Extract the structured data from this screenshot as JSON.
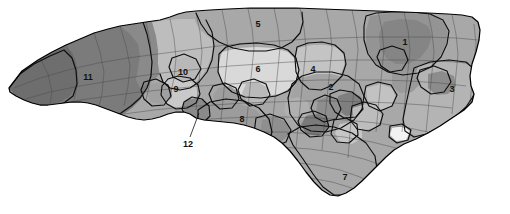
{
  "map": {
    "name": "north-carolina-congressional-districts",
    "background_color": "#ffffff",
    "state_outline_color": "#000000",
    "district_border_color": "#0d0d0d",
    "county_border_color": "#4a4a4a",
    "label_color": "#111111",
    "palette": {
      "darkest": "#6e6e6e",
      "dark": "#7b7b7b",
      "mid_dark": "#878787",
      "mid": "#949494",
      "mid_light": "#a3a3a3",
      "light": "#b4b4b4",
      "lighter": "#c4c4c4",
      "lightest": "#d9d9d9",
      "white": "#f4f4f4"
    },
    "districts": [
      {
        "id": "1",
        "label": "1",
        "x": 405,
        "y": 43,
        "fill": "#949494"
      },
      {
        "id": "2",
        "label": "2",
        "x": 331,
        "y": 88,
        "fill": "#a3a3a3"
      },
      {
        "id": "3",
        "label": "3",
        "x": 452,
        "y": 90,
        "fill": "#b4b4b4"
      },
      {
        "id": "4",
        "label": "4",
        "x": 313,
        "y": 70,
        "fill": "#c4c4c4"
      },
      {
        "id": "5",
        "label": "5",
        "x": 258,
        "y": 25,
        "fill": "#a8a8a8"
      },
      {
        "id": "6",
        "label": "6",
        "x": 258,
        "y": 70,
        "fill": "#d9d9d9"
      },
      {
        "id": "7",
        "label": "7",
        "x": 345,
        "y": 178,
        "fill": "#a8a8a8"
      },
      {
        "id": "8",
        "label": "8",
        "x": 242,
        "y": 120,
        "fill": "#9c9c9c"
      },
      {
        "id": "9",
        "label": "9",
        "x": 176,
        "y": 90,
        "fill": "#c9c9c9"
      },
      {
        "id": "10",
        "label": "10",
        "x": 183,
        "y": 73,
        "fill": "#bdbdbd"
      },
      {
        "id": "11",
        "label": "11",
        "x": 88,
        "y": 78,
        "fill": "#7b7b7b"
      },
      {
        "id": "12",
        "label": "12",
        "x": 188,
        "y": 145,
        "fill": "#8a8a8a"
      }
    ],
    "callouts": [
      {
        "label": "12",
        "label_x": 188,
        "label_y": 145,
        "leader_from_x": 190,
        "leader_from_y": 137,
        "leader_to_x": 199,
        "leader_to_y": 113
      }
    ]
  }
}
